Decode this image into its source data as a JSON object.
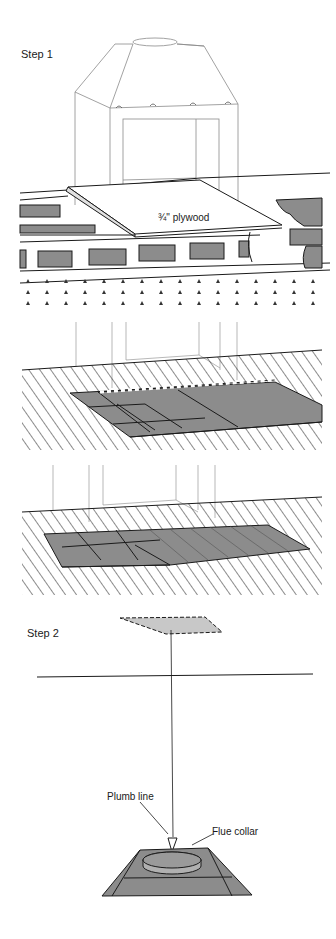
{
  "figure": {
    "steps": [
      {
        "label": "Step 1",
        "panels": [
          {
            "name": "fireplace-on-plywood",
            "annotations": [
              "¾\" plywood"
            ]
          },
          {
            "name": "floor-tiles-partial",
            "annotations": []
          },
          {
            "name": "floor-tiles-complete",
            "annotations": []
          }
        ]
      },
      {
        "label": "Step 2",
        "panels": [
          {
            "name": "plumb-line-alignment",
            "annotations": [
              "Plumb line",
              "Flue collar"
            ]
          }
        ]
      }
    ],
    "labels": {
      "step1": "Step 1",
      "plywood": "¾\" plywood",
      "step2": "Step 2",
      "plumb_line": "Plumb line",
      "flue_collar": "Flue collar"
    },
    "colors": {
      "ink": "#1a1a1a",
      "fill_gray": "#8c8c8c",
      "fill_light": "#c8c8c8",
      "faint_line": "#9a9a9a",
      "background": "#ffffff"
    }
  }
}
